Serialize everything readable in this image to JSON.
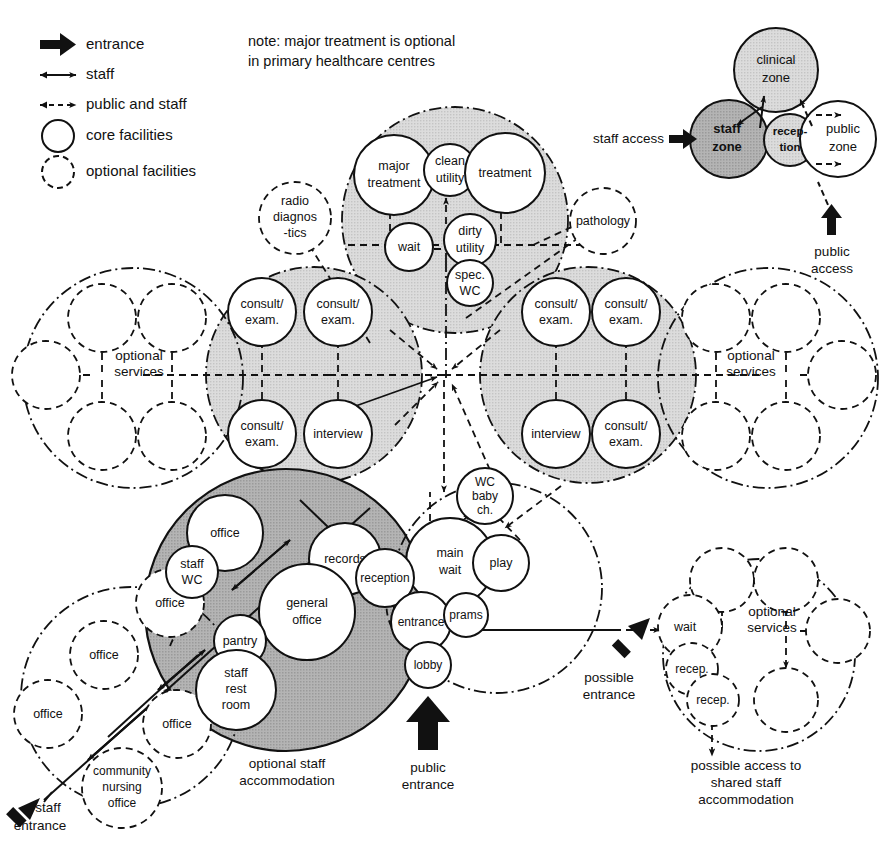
{
  "diagram": {
    "note": {
      "line1": "note: major treatment is optional",
      "line2": "in primary healthcare centres"
    },
    "colors": {
      "stroke": "#111111",
      "background": "#ffffff",
      "zone_light": "#d8d8d8",
      "zone_mid": "#c9c9c9",
      "zone_dark": "#a8a8a8",
      "circle_fill": "#ffffff"
    }
  },
  "legend": {
    "items": [
      {
        "key": "entrance",
        "label": "entrance",
        "symbol": "thick-block-arrow-icon"
      },
      {
        "key": "staff",
        "label": "staff",
        "symbol": "solid-double-arrow-icon"
      },
      {
        "key": "public_and_staff",
        "label": "public and staff",
        "symbol": "dashed-double-arrow-icon"
      },
      {
        "key": "core",
        "label": "core facilities",
        "symbol": "solid-circle-icon"
      },
      {
        "key": "optional",
        "label": "optional facilities",
        "symbol": "dashed-circle-icon"
      }
    ]
  },
  "zone_key": {
    "zones": [
      {
        "key": "clinical",
        "label_line1": "clinical",
        "label_line2": "zone",
        "fill": "light"
      },
      {
        "key": "staff",
        "label_line1": "staff",
        "label_line2": "zone",
        "fill": "dark"
      },
      {
        "key": "reception",
        "label_line1": "recep-",
        "label_line2": "tion",
        "fill": "mid"
      },
      {
        "key": "public",
        "label_line1": "public",
        "label_line2": "zone",
        "fill": "white"
      }
    ],
    "staff_access_label": "staff access",
    "public_access_label_line1": "public",
    "public_access_label_line2": "access"
  },
  "clusters": {
    "treatment": {
      "nodes": [
        {
          "id": "major_treatment",
          "lines": [
            "major",
            "treatment"
          ],
          "type": "core"
        },
        {
          "id": "clean_utility",
          "lines": [
            "clean",
            "utility"
          ],
          "type": "core"
        },
        {
          "id": "treatment",
          "lines": [
            "treatment"
          ],
          "type": "core"
        },
        {
          "id": "wait_treatment",
          "lines": [
            "wait"
          ],
          "type": "core"
        },
        {
          "id": "dirty_utility",
          "lines": [
            "dirty",
            "utility"
          ],
          "type": "core"
        },
        {
          "id": "spec_wc",
          "lines": [
            "spec.",
            "WC"
          ],
          "type": "core"
        }
      ]
    },
    "diagnostics": {
      "nodes": [
        {
          "id": "radio_diagnostics",
          "lines": [
            "radio",
            "diagnos",
            "-tics"
          ],
          "type": "optional"
        },
        {
          "id": "pathology",
          "lines": [
            "pathology"
          ],
          "type": "optional"
        }
      ]
    },
    "consult_left": {
      "nodes": [
        {
          "id": "consult_exam_l1",
          "lines": [
            "consult/",
            "exam."
          ],
          "type": "core"
        },
        {
          "id": "consult_exam_l2",
          "lines": [
            "consult/",
            "exam."
          ],
          "type": "core"
        },
        {
          "id": "consult_exam_l3",
          "lines": [
            "consult/",
            "exam."
          ],
          "type": "core"
        },
        {
          "id": "interview_left",
          "lines": [
            "interview"
          ],
          "type": "core"
        }
      ]
    },
    "consult_right": {
      "nodes": [
        {
          "id": "consult_exam_r1",
          "lines": [
            "consult/",
            "exam."
          ],
          "type": "core"
        },
        {
          "id": "consult_exam_r2",
          "lines": [
            "consult/",
            "exam."
          ],
          "type": "core"
        },
        {
          "id": "interview_right",
          "lines": [
            "interview"
          ],
          "type": "core"
        },
        {
          "id": "consult_exam_r3",
          "lines": [
            "consult/",
            "exam."
          ],
          "type": "core"
        }
      ]
    },
    "optional_services_left": {
      "label_line1": "optional",
      "label_line2": "services",
      "empty_circles": 5
    },
    "optional_services_right": {
      "label_line1": "optional",
      "label_line2": "services",
      "empty_circles": 5
    },
    "optional_services_bottom_right": {
      "label_line1": "optional",
      "label_line2": "services",
      "empty_circles": 4
    },
    "staff_zone": {
      "nodes": [
        {
          "id": "office_top",
          "lines": [
            "office"
          ],
          "type": "core"
        },
        {
          "id": "staff_wc",
          "lines": [
            "staff",
            "WC"
          ],
          "type": "core"
        },
        {
          "id": "records",
          "lines": [
            "records"
          ],
          "type": "core"
        },
        {
          "id": "general_office",
          "lines": [
            "general",
            "office"
          ],
          "type": "core"
        },
        {
          "id": "pantry",
          "lines": [
            "pantry"
          ],
          "type": "core"
        },
        {
          "id": "staff_rest_room",
          "lines": [
            "staff",
            "rest",
            "room"
          ],
          "type": "core"
        },
        {
          "id": "office_overlap",
          "lines": [
            "office"
          ],
          "type": "optional"
        }
      ],
      "caption_line1": "optional staff",
      "caption_line2": "accommodation"
    },
    "staff_accommodation": {
      "nodes": [
        {
          "id": "office_a",
          "lines": [
            "office"
          ],
          "type": "optional"
        },
        {
          "id": "office_b",
          "lines": [
            "office"
          ],
          "type": "optional"
        },
        {
          "id": "office_c",
          "lines": [
            "office"
          ],
          "type": "optional"
        },
        {
          "id": "community_nursing",
          "lines": [
            "community",
            "nursing",
            "office"
          ],
          "type": "optional"
        }
      ]
    },
    "public_zone": {
      "nodes": [
        {
          "id": "reception",
          "lines": [
            "reception"
          ],
          "type": "core"
        },
        {
          "id": "main_wait",
          "lines": [
            "main",
            "wait"
          ],
          "type": "core"
        },
        {
          "id": "wc_baby_ch",
          "lines": [
            "WC",
            "baby",
            "ch."
          ],
          "type": "core"
        },
        {
          "id": "play",
          "lines": [
            "play"
          ],
          "type": "core"
        },
        {
          "id": "entrance_node",
          "lines": [
            "entrance"
          ],
          "type": "core"
        },
        {
          "id": "prams",
          "lines": [
            "prams"
          ],
          "type": "core"
        },
        {
          "id": "lobby",
          "lines": [
            "lobby"
          ],
          "type": "core"
        }
      ]
    },
    "shared_branch": {
      "nodes": [
        {
          "id": "wait_branch",
          "lines": [
            "wait"
          ],
          "type": "optional"
        },
        {
          "id": "recep_1",
          "lines": [
            "recep."
          ],
          "type": "optional"
        },
        {
          "id": "recep_2",
          "lines": [
            "recep."
          ],
          "type": "optional"
        }
      ]
    }
  },
  "annotations": {
    "public_entrance_line1": "public",
    "public_entrance_line2": "entrance",
    "staff_entrance_line1": "staff",
    "staff_entrance_line2": "entrance",
    "possible_entrance_line1": "possible",
    "possible_entrance_line2": "entrance",
    "possible_access_line1": "possible access to",
    "possible_access_line2": "shared staff",
    "possible_access_line3": "accommodation"
  }
}
